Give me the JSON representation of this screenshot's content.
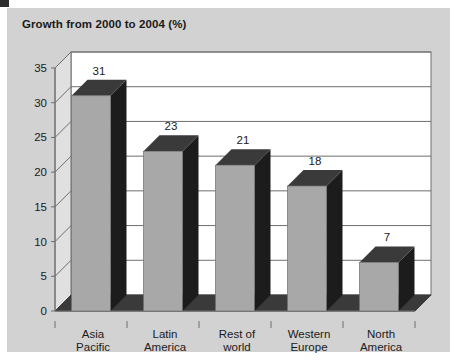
{
  "panel": {
    "background_color": "#d2d2d2",
    "page_background_color": "#ffffff"
  },
  "chart_data": {
    "type": "bar",
    "title": "Growth from 2000 to 2004 (%)",
    "xlabel": "",
    "ylabel": "",
    "categories": [
      "Asia Pacific",
      "Latin America",
      "Rest of world",
      "Western Europe",
      "North America"
    ],
    "category_lines": [
      [
        "Asia",
        "Pacific"
      ],
      [
        "Latin",
        "America"
      ],
      [
        "Rest of",
        "world"
      ],
      [
        "Western",
        "Europe"
      ],
      [
        "North",
        "America"
      ]
    ],
    "values": [
      31,
      23,
      21,
      18,
      7
    ],
    "value_labels": [
      "31",
      "23",
      "21",
      "18",
      "7"
    ],
    "ylim": [
      0,
      35
    ],
    "ytick_values": [
      0,
      5,
      10,
      15,
      20,
      25,
      30,
      35
    ],
    "ytick_labels": [
      "0",
      "5",
      "10",
      "15",
      "20",
      "25",
      "30",
      "35"
    ],
    "grid": true,
    "legend": false,
    "style": "3d-column",
    "bar_front_color": "#a8a8a8",
    "bar_side_color": "#1c1c1c",
    "bar_top_color": "#3a3a3a",
    "floor_color": "#3a3a3a",
    "wall_color": "#ffffff",
    "wall_side_color": "#e0e0e0",
    "gridline_color": "#6e6e6e",
    "axis_color": "#6e6e6e"
  }
}
